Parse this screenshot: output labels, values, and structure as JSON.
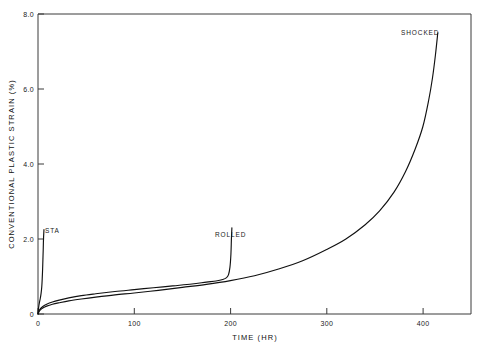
{
  "chart_data": {
    "type": "line",
    "title": "",
    "xlabel": "TIME (HR)",
    "ylabel": "CONVENTIONAL PLASTIC STRAIN (%)",
    "xlim": [
      0,
      450
    ],
    "ylim": [
      0,
      8.0
    ],
    "grid": false,
    "legend_position": "inline-annotations",
    "xticks": [
      0,
      100,
      200,
      300,
      400
    ],
    "xtick_labels": [
      "0",
      "100",
      "200",
      "300",
      "400"
    ],
    "yticks": [
      0,
      2.0,
      4.0,
      6.0,
      8.0
    ],
    "ytick_labels": [
      "0",
      "2.0",
      "4.0",
      "6.0",
      "8.0"
    ],
    "annotations": [
      {
        "text": "STA",
        "x": 13,
        "y": 2.45
      },
      {
        "text": "ROLLED",
        "x": 118,
        "y": 2.25
      },
      {
        "text": "SHOCKED",
        "x": 382,
        "y": 7.85
      }
    ],
    "series": [
      {
        "name": "STA",
        "x": [
          0,
          0.4,
          0.9,
          1.6,
          2.4,
          3.2,
          3.9,
          4.4,
          4.8,
          5.1,
          5.4,
          5.6,
          5.8,
          6.0,
          6.1,
          6.2
        ],
        "values": [
          0,
          0.12,
          0.22,
          0.32,
          0.42,
          0.55,
          0.72,
          0.95,
          1.2,
          1.45,
          1.7,
          1.9,
          2.05,
          2.15,
          2.2,
          2.25
        ]
      },
      {
        "name": "ROLLED",
        "x": [
          0,
          1,
          2.5,
          5,
          9,
          15,
          22,
          32,
          45,
          60,
          80,
          100,
          120,
          140,
          160,
          175,
          185,
          192,
          196,
          198,
          199.5,
          200.5,
          201,
          201.5
        ],
        "values": [
          0,
          0.08,
          0.14,
          0.2,
          0.26,
          0.32,
          0.37,
          0.43,
          0.49,
          0.54,
          0.6,
          0.65,
          0.7,
          0.75,
          0.8,
          0.85,
          0.88,
          0.92,
          0.97,
          1.05,
          1.25,
          1.6,
          2.0,
          2.3
        ]
      },
      {
        "name": "SHOCKED",
        "x": [
          0,
          1,
          2.5,
          5,
          9,
          15,
          22,
          32,
          45,
          60,
          80,
          100,
          125,
          150,
          175,
          200,
          225,
          250,
          275,
          300,
          320,
          340,
          355,
          370,
          382,
          392,
          400,
          406,
          410,
          413,
          415.5
        ],
        "values": [
          0,
          0.06,
          0.11,
          0.16,
          0.21,
          0.26,
          0.3,
          0.35,
          0.4,
          0.45,
          0.51,
          0.56,
          0.63,
          0.71,
          0.79,
          0.89,
          1.02,
          1.2,
          1.42,
          1.72,
          2.0,
          2.38,
          2.75,
          3.25,
          3.8,
          4.4,
          5.0,
          5.7,
          6.3,
          6.9,
          7.5
        ]
      }
    ]
  },
  "axes": {
    "x_title": "TIME (HR)",
    "y_title": "CONVENTIONAL PLASTIC STRAIN (%)"
  },
  "ticks": {
    "x": [
      "0",
      "100",
      "200",
      "300",
      "400"
    ],
    "y": [
      "0",
      "2.0",
      "4.0",
      "6.0",
      "8.0"
    ]
  },
  "labels": {
    "sta": "STA",
    "rolled": "ROLLED",
    "shocked": "SHOCKED"
  },
  "colors": {
    "curve": "#111111",
    "frame": "#3a3a3a",
    "background": "#ffffff",
    "text": "#1a1a1a"
  }
}
